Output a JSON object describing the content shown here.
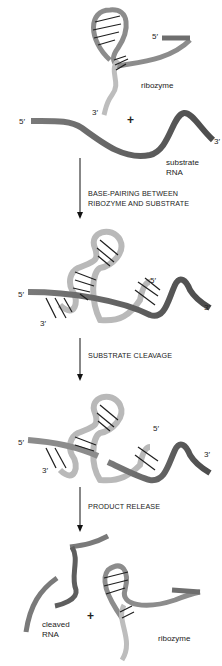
{
  "figure": {
    "stages": [
      {
        "id": "initial",
        "labels": {
          "ribozyme": "ribozyme",
          "ribozyme_5": "5′",
          "ribozyme_3": "3′",
          "substrate_5": "5′",
          "substrate_3": "3′",
          "substrate_line1": "substrate",
          "substrate_line2": "RNA",
          "plus": "+"
        }
      },
      {
        "id": "complex",
        "labels": {
          "left_5": "5′",
          "left_3": "3′",
          "right_5": "5′",
          "right_3": "3′"
        }
      },
      {
        "id": "cleaved-complex",
        "labels": {
          "left_5": "5′",
          "left_3": "3′",
          "right_5": "5′",
          "right_3": "3′"
        }
      },
      {
        "id": "products",
        "labels": {
          "cleaved_line1": "cleaved",
          "cleaved_line2": "RNA",
          "ribozyme": "ribozyme",
          "plus": "+"
        }
      }
    ],
    "steps": [
      {
        "line1": "BASE-PAIRING BETWEEN",
        "line2": "RIBOZYME AND SUBSTRATE"
      },
      {
        "line1": "SUBSTRATE CLEAVAGE"
      },
      {
        "line1": "PRODUCT RELEASE"
      }
    ],
    "colors": {
      "ribozyme_light": "#b9b9b9",
      "ribozyme_mid": "#8c8c8c",
      "substrate_dark": "#5e5e5e",
      "base_pair": "#1e1e1e",
      "arrow": "#111111"
    }
  }
}
